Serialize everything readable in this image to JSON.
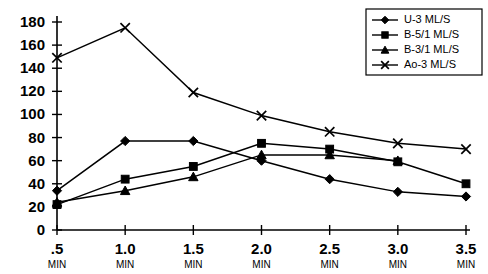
{
  "chart_data": {
    "type": "line",
    "title": "",
    "xlabel": "",
    "ylabel": "",
    "ylim": [
      0,
      180
    ],
    "grid": false,
    "legend_position": "top-right",
    "x": [
      0.5,
      1.0,
      1.5,
      2.0,
      2.5,
      3.0,
      3.5
    ],
    "categories": [
      ".5",
      "1.0",
      "1.5",
      "2.0",
      "2.5",
      "3.0",
      "3.5"
    ],
    "x_tick_unit": "MIN",
    "y_ticks": [
      0,
      20,
      40,
      60,
      80,
      100,
      120,
      140,
      160,
      180
    ],
    "series": [
      {
        "name": "U-3 ML/S",
        "marker": "diamond",
        "values": [
          34,
          77,
          77,
          60,
          44,
          33,
          29
        ]
      },
      {
        "name": "B-5/1 ML/S",
        "marker": "square",
        "values": [
          22,
          44,
          55,
          75,
          70,
          59,
          40
        ]
      },
      {
        "name": "B-3/1 ML/S",
        "marker": "triangle",
        "values": [
          24,
          34,
          46,
          65,
          65,
          60,
          null
        ]
      },
      {
        "name": "Ao-3 ML/S",
        "marker": "cross",
        "values": [
          149,
          175,
          119,
          99,
          85,
          75,
          70
        ]
      }
    ]
  },
  "legend": {
    "entries": [
      {
        "label": "U-3 ML/S",
        "marker": "diamond"
      },
      {
        "label": "B-5/1 ML/S",
        "marker": "square"
      },
      {
        "label": "B-3/1 ML/S",
        "marker": "triangle"
      },
      {
        "label": "Ao-3 ML/S",
        "marker": "cross"
      }
    ]
  },
  "colors": {
    "axis": "#000000",
    "series": "#000000",
    "background": "#ffffff"
  }
}
